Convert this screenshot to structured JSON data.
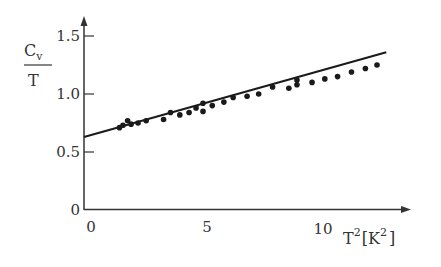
{
  "chart_data": {
    "type": "scatter",
    "title": "",
    "xlabel": "T²[K²]",
    "ylabel": "Cv/T",
    "xlim": [
      0,
      14
    ],
    "ylim": [
      0,
      1.6
    ],
    "grid": false,
    "legend": null,
    "x_ticks": [
      0,
      5,
      10
    ],
    "x_tick_labels": [
      "0",
      "5",
      "10"
    ],
    "y_ticks": [
      0,
      0.5,
      1.0,
      1.5
    ],
    "y_tick_labels": [
      "0",
      "0.5",
      "1.0",
      "1.5"
    ],
    "series": [
      {
        "name": "data",
        "kind": "scatter",
        "x": [
          1.4,
          1.55,
          1.75,
          1.9,
          2.2,
          2.55,
          3.3,
          3.6,
          4.0,
          4.4,
          4.7,
          5.0,
          5.0,
          5.4,
          5.9,
          6.3,
          6.9,
          7.4,
          8.0,
          8.7,
          9.05,
          9.05,
          9.7,
          10.25,
          10.8,
          11.4,
          12.0,
          12.5
        ],
        "y": [
          0.71,
          0.73,
          0.77,
          0.74,
          0.75,
          0.77,
          0.78,
          0.84,
          0.82,
          0.84,
          0.88,
          0.85,
          0.92,
          0.9,
          0.93,
          0.97,
          0.98,
          1.0,
          1.06,
          1.05,
          1.08,
          1.12,
          1.1,
          1.13,
          1.15,
          1.19,
          1.22,
          1.25
        ]
      },
      {
        "name": "linear fit",
        "kind": "line",
        "x": [
          0,
          12.9
        ],
        "y": [
          0.63,
          1.36
        ]
      }
    ]
  },
  "labels": {
    "y_numerator": "C",
    "y_numerator_sub": "v",
    "y_denominator": "T",
    "x_T": "T",
    "x_sup1": "2",
    "x_bracket_open": "[K",
    "x_sup2": "2",
    "x_bracket_close": "]"
  }
}
